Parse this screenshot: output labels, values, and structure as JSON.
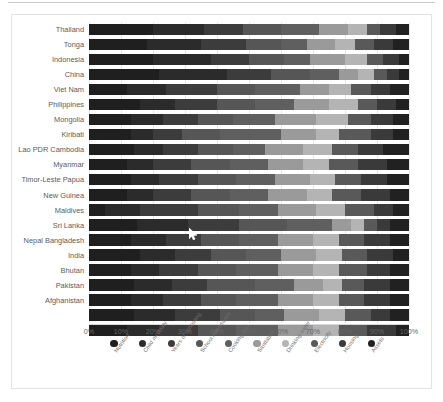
{
  "chart": {
    "type": "bar",
    "title": "",
    "xlabel": "",
    "ylabel": ""
  },
  "xaxis": {
    "ticks": [
      "0%",
      "10%",
      "20%",
      "30%",
      "40%",
      "50%",
      "60%",
      "70%",
      "80%",
      "90%",
      "100%"
    ],
    "min": 0,
    "max": 100
  },
  "legend": {
    "position": "bottom",
    "items": [
      {
        "label": "Nutrition",
        "color": "#1f1f1f"
      },
      {
        "label": "Child mortality",
        "color": "#2b2b2b"
      },
      {
        "label": "Years of schooling",
        "color": "#3c3c3c"
      },
      {
        "label": "School Attendance",
        "color": "#565656"
      },
      {
        "label": "Cooking fuel",
        "color": "#5f5f5f"
      },
      {
        "label": "Sanitation",
        "color": "#9a9a9a"
      },
      {
        "label": "Drinking water",
        "color": "#b4b4b4"
      },
      {
        "label": "Electricity",
        "color": "#595959"
      },
      {
        "label": "Housing",
        "color": "#3a3a3a"
      },
      {
        "label": "Assets",
        "color": "#212121"
      }
    ]
  },
  "chart_data": {
    "type": "bar",
    "orientation": "horizontal",
    "stacked": true,
    "normalized": true,
    "title": "",
    "xlabel": "",
    "ylabel": "",
    "xlim": [
      0,
      100
    ],
    "grid": true,
    "legend_position": "bottom",
    "categories": [
      "Thailand",
      "Tonga",
      "Indonesia",
      "China",
      "Viet Nam",
      "Philippines",
      "Mongolia",
      "Kiribati",
      "Lao PDR Cambodia",
      "Myanmar",
      "Timor-Leste Papua",
      "New Guinea",
      "Maldives",
      "Sri Lanka",
      "Nepal Bangladesh",
      "India",
      "Bhutan",
      "Pakistan",
      "Afghanistan",
      "",
      ""
    ],
    "series": [
      {
        "name": "Nutrition",
        "color": "#1f1f1f",
        "values": [
          20,
          18,
          20,
          22,
          12,
          16,
          13,
          13,
          14,
          12,
          13,
          12,
          5,
          15,
          13,
          16,
          13,
          14,
          13,
          14,
          12
        ]
      },
      {
        "name": "Child mortality",
        "color": "#2b2b2b",
        "values": [
          16,
          17,
          18,
          21,
          12,
          11,
          10,
          7,
          9,
          8,
          9,
          8,
          11,
          16,
          11,
          11,
          9,
          12,
          10,
          13,
          10
        ]
      },
      {
        "name": "Years of schooling",
        "color": "#3c3c3c",
        "values": [
          12,
          14,
          12,
          14,
          16,
          13,
          11,
          9,
          11,
          12,
          12,
          12,
          18,
          16,
          11,
          11,
          12,
          11,
          12,
          14,
          12
        ]
      },
      {
        "name": "School Attendance",
        "color": "#565656",
        "values": [
          12,
          11,
          11,
          12,
          12,
          12,
          11,
          12,
          11,
          12,
          12,
          12,
          13,
          15,
          12,
          11,
          12,
          15,
          11,
          11,
          12
        ]
      },
      {
        "name": "Cooking fuel",
        "color": "#5f5f5f",
        "values": [
          12,
          8,
          8,
          9,
          14,
          12,
          13,
          19,
          10,
          12,
          12,
          12,
          12,
          14,
          12,
          11,
          13,
          12,
          13,
          9,
          13
        ]
      },
      {
        "name": "Sanitation",
        "color": "#9a9a9a",
        "values": [
          9,
          9,
          11,
          6,
          9,
          11,
          13,
          11,
          12,
          11,
          11,
          12,
          12,
          6,
          11,
          11,
          11,
          9,
          11,
          11,
          11
        ]
      },
      {
        "name": "Drinking water",
        "color": "#b4b4b4",
        "values": [
          6,
          6,
          7,
          5,
          7,
          9,
          10,
          7,
          9,
          8,
          8,
          8,
          9,
          4,
          8,
          8,
          8,
          6,
          8,
          8,
          8
        ]
      },
      {
        "name": "Electricity",
        "color": "#595959",
        "values": [
          4,
          6,
          5,
          4,
          6,
          6,
          7,
          10,
          8,
          9,
          8,
          9,
          9,
          4,
          8,
          8,
          9,
          7,
          8,
          8,
          9
        ]
      },
      {
        "name": "Housing",
        "color": "#3a3a3a",
        "values": [
          5,
          6,
          5,
          4,
          6,
          6,
          7,
          7,
          8,
          9,
          8,
          9,
          6,
          4,
          8,
          8,
          7,
          8,
          8,
          6,
          9
        ]
      },
      {
        "name": "Assets",
        "color": "#212121",
        "values": [
          4,
          5,
          3,
          3,
          6,
          4,
          5,
          5,
          8,
          7,
          7,
          6,
          5,
          6,
          6,
          5,
          6,
          6,
          6,
          6,
          4
        ]
      }
    ]
  }
}
